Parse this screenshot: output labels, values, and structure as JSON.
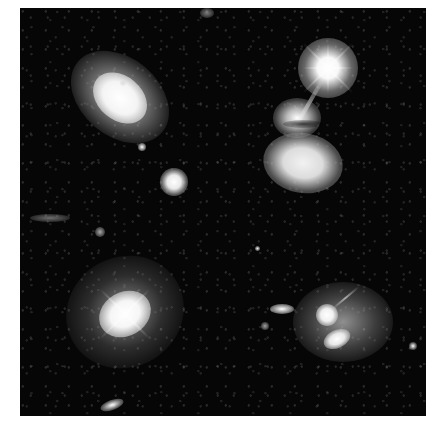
{
  "image": {
    "description": "Four-panel grayscale mosaic of galaxies on black sky background",
    "panels": [
      {
        "position": "top-left",
        "subject": "tilted spiral galaxy with bright core and small companion galaxy below right"
      },
      {
        "position": "top-right",
        "subject": "bright foreground star with diffraction spikes above an interacting irregular galaxy pair"
      },
      {
        "position": "bottom-left",
        "subject": "bright elliptical galaxy with diffuse halo and small edge-on galaxy near bottom"
      },
      {
        "position": "bottom-right",
        "subject": "merging galaxy system with two bright nuclei and small elongated neighbor to the left"
      }
    ],
    "colors": {
      "background": "#ffffff",
      "sky": "#050505",
      "galaxy_core": "#ffffff"
    }
  }
}
